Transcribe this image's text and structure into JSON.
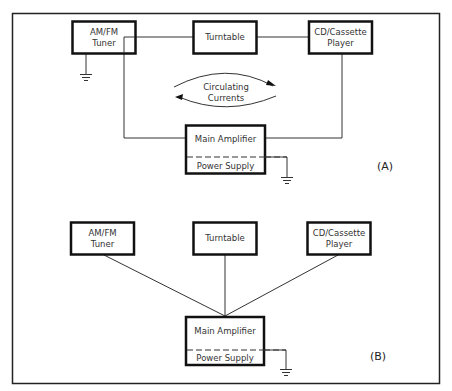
{
  "panels": [
    {
      "id": "A",
      "label": "(A)",
      "components": {
        "tuner": [
          "AM/FM",
          "Tuner"
        ],
        "turntable": [
          "Turntable"
        ],
        "cd_player": [
          "CD/Cassette",
          "Player"
        ],
        "main_amplifier": "Main Amplifier",
        "power_supply": "Power Supply"
      },
      "annotation": [
        "Circulating",
        "Currents"
      ]
    },
    {
      "id": "B",
      "label": "(B)",
      "components": {
        "tuner": [
          "AM/FM",
          "Tuner"
        ],
        "turntable": [
          "Turntable"
        ],
        "cd_player": [
          "CD/Cassette",
          "Player"
        ],
        "main_amplifier": "Main Amplifier",
        "power_supply": "Power Supply"
      }
    }
  ]
}
